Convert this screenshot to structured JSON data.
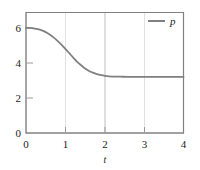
{
  "chart_data": {
    "type": "line",
    "title": "",
    "subtitle": "",
    "xlabel": "t",
    "ylabel": "",
    "xlim": [
      0,
      4
    ],
    "ylim": [
      0,
      6.9
    ],
    "xticks": [
      0,
      1,
      2,
      3,
      4
    ],
    "xticklabels": [
      "0",
      "1",
      "2",
      "3",
      "4"
    ],
    "yticks": [
      0,
      2,
      4,
      6
    ],
    "yticklabels": [
      "0",
      "2",
      "4",
      "6"
    ],
    "grid": "vertical-only",
    "gridlines_x": [
      1,
      2,
      3
    ],
    "legend_position": "top-right",
    "legend": [
      "p"
    ],
    "series": [
      {
        "name": "p",
        "color": "#808080",
        "linewidth": 1.8,
        "x": [
          0.0,
          0.1,
          0.2,
          0.3,
          0.4,
          0.5,
          0.6,
          0.7,
          0.8,
          0.9,
          1.0,
          1.1,
          1.2,
          1.3,
          1.4,
          1.5,
          1.6,
          1.7,
          1.8,
          1.9,
          2.0,
          2.2,
          2.4,
          2.6,
          2.8,
          3.0,
          3.2,
          3.4,
          3.6,
          3.8,
          4.0
        ],
        "values": [
          6.0,
          5.99,
          5.96,
          5.92,
          5.85,
          5.75,
          5.62,
          5.45,
          5.25,
          5.04,
          4.8,
          4.55,
          4.3,
          4.06,
          3.86,
          3.68,
          3.54,
          3.44,
          3.36,
          3.3,
          3.26,
          3.22,
          3.21,
          3.2,
          3.2,
          3.2,
          3.2,
          3.2,
          3.2,
          3.2,
          3.2
        ]
      }
    ],
    "annotations": {
      "start_value": 6.0,
      "plateau_value": 3.2,
      "inflection_t": 1.2
    },
    "colors": {
      "axis": "#808080",
      "gridline": "#c8c8c8",
      "curve": "#808080",
      "text": "#1a1a1a",
      "background": "#ffffff"
    }
  },
  "legend": {
    "entries": [
      {
        "label": "p",
        "swatch_color": "#808080"
      }
    ]
  },
  "axes": {
    "x": {
      "label": "t",
      "ticklabels": [
        "0",
        "1",
        "2",
        "3",
        "4"
      ]
    },
    "y": {
      "label": "",
      "ticklabels": [
        "0",
        "2",
        "4",
        "6"
      ]
    }
  }
}
